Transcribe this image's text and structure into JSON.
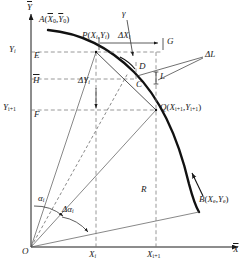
{
  "figure": {
    "type": "geometric-diagram",
    "background_color": "#ffffff",
    "ink_color": "#1a1a1a"
  },
  "axes": {
    "y_axis_label": "Y",
    "x_axis_label": "X",
    "origin_label": "O"
  },
  "axis_ticks": {
    "y": [
      {
        "id": "Yi",
        "main": "Y",
        "sub": "i"
      },
      {
        "id": "Yi1",
        "main": "Y",
        "sub": "i+1"
      }
    ],
    "x": [
      {
        "id": "Xi",
        "main": "X",
        "sub": "i"
      },
      {
        "id": "Xi1",
        "main": "X",
        "sub": "i+1"
      }
    ]
  },
  "points": {
    "A": {
      "label": "A",
      "coords": "(X0,Y0)",
      "x_sub": "0",
      "y_sub": "0"
    },
    "B": {
      "label": "B",
      "coords": "(Xe,Ye)",
      "x_sub": "e",
      "y_sub": "e"
    },
    "P": {
      "label": "P",
      "coords": "(Xi,Yi)",
      "x_sub": "i",
      "y_sub": "i"
    },
    "Q": {
      "label": "Q",
      "coords": "(Xi+1,Yi+1)",
      "x_sub": "i+1",
      "y_sub": "i+1"
    },
    "C": {
      "label": "C"
    },
    "D": {
      "label": "D"
    },
    "E": {
      "label": "E"
    },
    "F": {
      "label": "F"
    },
    "G": {
      "label": "G"
    },
    "H": {
      "label": "H"
    },
    "L": {
      "label": "L"
    }
  },
  "annotations": {
    "gamma": "γ",
    "delta_x": {
      "main": "ΔX",
      "sub": "i"
    },
    "delta_y": {
      "main": "ΔY",
      "sub": "i"
    },
    "delta_l": "ΔL",
    "radius": "R",
    "alpha": {
      "main": "α",
      "sub": "i"
    },
    "delta_alpha": {
      "main": "Δα",
      "sub": "i"
    }
  }
}
